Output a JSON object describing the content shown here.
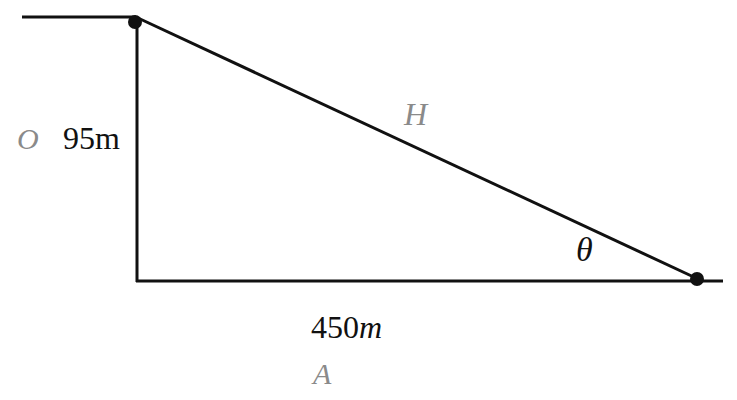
{
  "diagram": {
    "type": "right-triangle",
    "labels": {
      "opposite_letter": "O",
      "opposite_value": "95m",
      "hypotenuse_letter": "H",
      "angle": "θ",
      "adjacent_value_number": "450",
      "adjacent_value_unit": "m",
      "adjacent_letter": "A"
    },
    "colors": {
      "line": "#111111",
      "letter_label": "#8a8a8a",
      "value_label": "#111111"
    }
  }
}
